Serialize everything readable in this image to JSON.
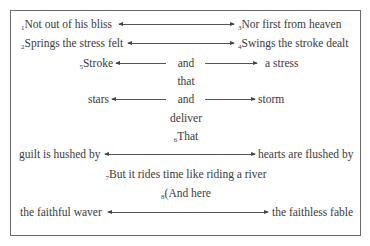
{
  "poem": {
    "lines": [
      {
        "num": "1",
        "left": "Not out of his bliss",
        "num_right": "3",
        "right": "Nor first from heaven"
      },
      {
        "num": "2",
        "left": "Springs the stress felt",
        "num_right": "4",
        "right": "Swings the stroke dealt"
      },
      {
        "num": "5",
        "left": "Stroke",
        "center": "and",
        "right": "a stress"
      },
      {
        "center": "that"
      },
      {
        "left": "stars",
        "center": "and",
        "right": "storm"
      },
      {
        "center": "deliver"
      },
      {
        "num": "6",
        "center": "That"
      },
      {
        "left": "guilt is hushed by",
        "right": "hearts are flushed by"
      },
      {
        "num": "7",
        "center": "But it rides time like riding a river"
      },
      {
        "num": "8",
        "center": "(And here"
      },
      {
        "left": "the faithful waver",
        "right": "the faithless fable"
      }
    ]
  },
  "colors": {
    "text": "#3a3a3a",
    "border": "#6a6a6a",
    "arrow": "#555555"
  }
}
